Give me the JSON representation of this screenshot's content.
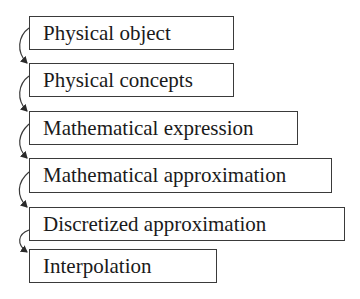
{
  "diagram": {
    "type": "flow-chain",
    "direction": "top-to-bottom",
    "steps": [
      {
        "label": "Physical object"
      },
      {
        "label": "Physical concepts"
      },
      {
        "label": "Mathematical expression"
      },
      {
        "label": "Mathematical approximation"
      },
      {
        "label": "Discretized approximation"
      },
      {
        "label": "Interpolation"
      }
    ],
    "edges": [
      {
        "from": "Physical object",
        "to": "Physical concepts"
      },
      {
        "from": "Physical concepts",
        "to": "Mathematical expression"
      },
      {
        "from": "Mathematical expression",
        "to": "Mathematical approximation"
      },
      {
        "from": "Mathematical approximation",
        "to": "Discretized approximation"
      },
      {
        "from": "Discretized approximation",
        "to": "Interpolation"
      }
    ],
    "colors": {
      "stroke": "#3a3a3a",
      "text": "#1a1a1a",
      "background": "#ffffff"
    }
  }
}
